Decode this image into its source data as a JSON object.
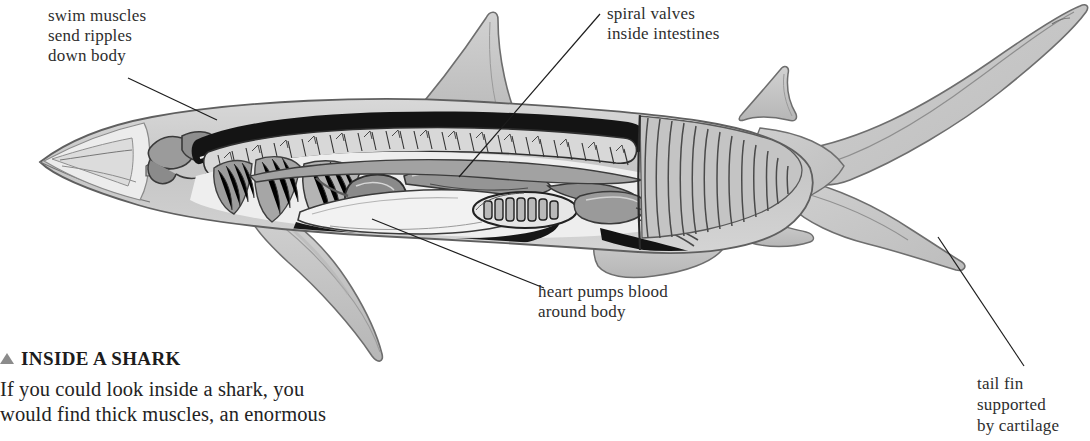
{
  "figure": {
    "subject": "shark",
    "style": "grayscale scientific cutaway drawing",
    "colors": {
      "page_background": "#ffffff",
      "body_fill": "#c9c9c9",
      "body_fill_light": "#e2e2e2",
      "fin_fill": "#c2c2c2",
      "outline": "#5a5a5a",
      "dark_cavity": "#111111",
      "organ_mid": "#8f8f8f",
      "organ_dark": "#6b6b6b",
      "organ_light": "#dcdcdc",
      "spine_band": "#d6d6d6",
      "muscle_stripe": "#8a8a8a",
      "leader_line": "#1d1d1d",
      "text": "#2e2e2e"
    },
    "parts": [
      "snout",
      "brain",
      "gill-arches",
      "spine-vertebrae",
      "swim-muscle-blocks",
      "liver",
      "heart",
      "stomach",
      "spiral-valve-intestine",
      "first-dorsal-fin",
      "second-dorsal-fin",
      "pectoral-fin",
      "pelvic-fin",
      "anal-fin",
      "caudal-tail-fin"
    ]
  },
  "callouts": [
    {
      "id": "swim-muscles",
      "text": "swim muscles\nsend ripples\ndown body",
      "leader": {
        "x1": 128,
        "y1": 78,
        "x2": 217,
        "y2": 120
      }
    },
    {
      "id": "spiral-valves",
      "text": "spiral valves\ninside intestines",
      "leader": {
        "x1": 600,
        "y1": 14,
        "x2": 459,
        "y2": 177
      }
    },
    {
      "id": "heart-pumps-blood",
      "text": "heart pumps blood\naround body",
      "leader": {
        "x1": 372,
        "y1": 219,
        "x2": 544,
        "y2": 288
      }
    },
    {
      "id": "tail-fin-cartilage",
      "text": "tail fin\nsupported\nby cartilage",
      "leader": {
        "x1": 938,
        "y1": 237,
        "x2": 1024,
        "y2": 366
      }
    }
  ],
  "caption": {
    "bullet_icon": "triangle-up-icon",
    "heading": "INSIDE A SHARK",
    "body": "If you could look inside a shark, you\nwould find thick muscles, an enormous"
  }
}
